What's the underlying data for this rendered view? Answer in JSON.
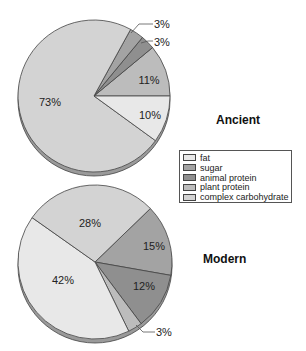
{
  "chart_data": [
    {
      "type": "pie",
      "title": "Ancient",
      "categories": [
        "fat",
        "sugar",
        "animal protein",
        "plant protein",
        "complex carbohydrate"
      ],
      "values": [
        10,
        3,
        3,
        11,
        73
      ],
      "labels": [
        "10%",
        "3%",
        "3%",
        "11%",
        "73%"
      ]
    },
    {
      "type": "pie",
      "title": "Modern",
      "categories": [
        "fat",
        "sugar",
        "animal protein",
        "plant protein",
        "complex carbohydrate"
      ],
      "values": [
        42,
        15,
        12,
        3,
        28
      ],
      "labels": [
        "42%",
        "15%",
        "12%",
        "3%",
        "28%"
      ]
    }
  ],
  "titles": {
    "ancient": "Ancient",
    "modern": "Modern"
  },
  "colors": {
    "fat": "#e8e8e8",
    "sugar": "#a3a3a3",
    "animal protein": "#8f8f8f",
    "plant protein": "#bcbcbc",
    "complex carbohydrate": "#d3d3d3",
    "outline": "#444444",
    "rim": "#9a9a9a"
  },
  "legend": {
    "items": [
      {
        "label": "fat",
        "key": "fat"
      },
      {
        "label": "sugar",
        "key": "sugar"
      },
      {
        "label": "animal protein",
        "key": "animal protein"
      },
      {
        "label": "plant protein",
        "key": "plant protein"
      },
      {
        "label": "complex carbohydrate",
        "key": "complex carbohydrate"
      }
    ]
  }
}
